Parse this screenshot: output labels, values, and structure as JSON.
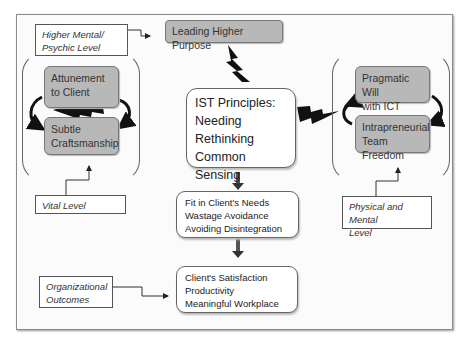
{
  "diagram": {
    "labels": {
      "higher_mental": [
        "Higher Mental/",
        "Psychic Level"
      ],
      "vital": "Vital Level",
      "physical_mental": [
        "Physical and Mental",
        "Level"
      ],
      "organizational": [
        "Organizational",
        "Outcomes"
      ]
    },
    "leading_purpose": "Leading Higher Purpose",
    "left_group": {
      "top": [
        "Attunement",
        "to Client"
      ],
      "bottom": [
        "Subtle",
        "Craftsmanship"
      ]
    },
    "right_group": {
      "top": [
        "Pragmatic Will",
        "with ICT"
      ],
      "bottom": [
        "Intrapreneurial",
        "Team Freedom"
      ]
    },
    "center": {
      "title": "IST Principles:",
      "items": [
        "Needing",
        "Rethinking",
        "Common Sensing"
      ]
    },
    "middle_box": [
      "Fit in Client's Needs",
      "Wastage Avoidance",
      "Avoiding Disintegration"
    ],
    "outcome_box": [
      "Client's Satisfaction",
      "Productivity",
      "Meaningful Workplace"
    ],
    "colors": {
      "gray_fill": "#b8b8b8",
      "arrow_dark": "#111111",
      "connector_gray": "#666666"
    }
  }
}
